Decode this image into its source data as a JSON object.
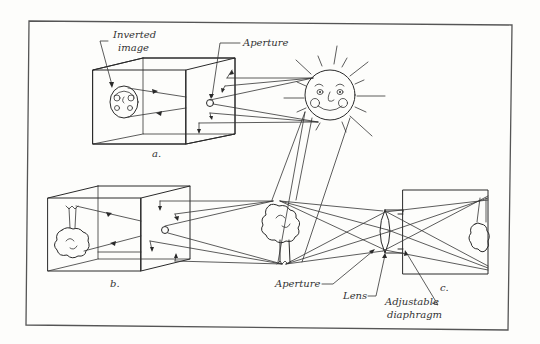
{
  "diagram": {
    "type": "optics-illustration",
    "panels": [
      {
        "id": "a",
        "label": "a.",
        "description": "Pinhole camera box imaging the sun; inverted image on back wall"
      },
      {
        "id": "b",
        "label": "b.",
        "description": "Pinhole camera box imaging a tree; inverted image on back wall"
      },
      {
        "id": "c",
        "label": "c.",
        "description": "Camera with lens and adjustable diaphragm imaging the tree"
      }
    ],
    "labels": {
      "inverted_image_line1": "Inverted",
      "inverted_image_line2": "image",
      "aperture_top": "Aperture",
      "aperture_bottom": "Aperture",
      "lens": "Lens",
      "diaphragm_line1": "Adjustable",
      "diaphragm_line2": "diaphragm",
      "panel_a": "a.",
      "panel_b": "b.",
      "panel_c": "c."
    },
    "colors": {
      "ink": "#2a2a2a",
      "paper": "#fdfdfb",
      "frame": "#555555"
    }
  }
}
